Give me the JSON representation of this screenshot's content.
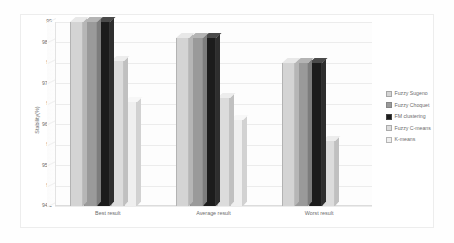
{
  "chart_data": {
    "type": "bar",
    "title": "",
    "subtitle": "",
    "xlabel": "",
    "ylabel": "Stability(%)",
    "categories": [
      "Best result",
      "Average result",
      "Worst result"
    ],
    "ylim": [
      94.5,
      99
    ],
    "yticks": [
      99,
      98.5,
      98,
      97.5,
      97,
      96.5,
      96,
      95.5,
      95,
      94.5
    ],
    "ytick_labels": [
      "99",
      "98.5",
      "98",
      "97.5",
      "97",
      "96.5",
      "96",
      "95.5",
      "95",
      "94.5"
    ],
    "grid": true,
    "legend_position": "right",
    "style": "3d-grouped-bars",
    "series": [
      {
        "name": "Fuzzy Sugeno",
        "color": "#d4d4d4",
        "top_color": "#e8e8e8",
        "side_color": "#b6b6b6",
        "values": [
          99,
          98.6,
          98
        ]
      },
      {
        "name": "Fuzzy Choquet",
        "color": "#9a9a9a",
        "top_color": "#b4b4b4",
        "side_color": "#7d7d7d",
        "values": [
          99,
          98.6,
          98
        ]
      },
      {
        "name": "FM clustering",
        "color": "#1c1c1c",
        "top_color": "#4a4a4a",
        "side_color": "#2e2e2e",
        "values": [
          99,
          98.6,
          98
        ]
      },
      {
        "name": "Fuzzy C-means",
        "color": "#dcdcdc",
        "top_color": "#ededed",
        "side_color": "#c0c0c0",
        "values": [
          98.05,
          97.15,
          96.1
        ]
      },
      {
        "name": "K-means",
        "color": "#efefef",
        "top_color": "#f7f7f7",
        "side_color": "#d2d2d2",
        "values": [
          97.05,
          96.6,
          94.5
        ]
      }
    ]
  },
  "legend": {
    "items": [
      {
        "label": "Fuzzy Sugeno",
        "color": "#d4d4d4"
      },
      {
        "label": "Fuzzy Choquet",
        "color": "#9a9a9a"
      },
      {
        "label": "FM clustering",
        "color": "#1c1c1c"
      },
      {
        "label": "Fuzzy C-means",
        "color": "#dcdcdc"
      },
      {
        "label": "K-means",
        "color": "#efefef"
      }
    ]
  }
}
